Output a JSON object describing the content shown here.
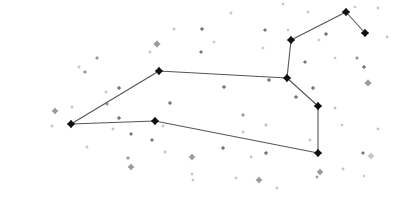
{
  "diagram": {
    "type": "constellation",
    "width": 393,
    "height": 203,
    "colors": {
      "background": "#ffffff",
      "line": "#555555",
      "main_star": "#111111",
      "faint_star_dark": "#777777",
      "faint_star_mid": "#9a9a9a",
      "faint_star_light": "#c4c4c4"
    },
    "main_stars": [
      {
        "id": "A",
        "x": 71,
        "y": 124
      },
      {
        "id": "B",
        "x": 159,
        "y": 71
      },
      {
        "id": "C",
        "x": 155,
        "y": 121
      },
      {
        "id": "D",
        "x": 287,
        "y": 78
      },
      {
        "id": "E",
        "x": 291,
        "y": 40
      },
      {
        "id": "F",
        "x": 346,
        "y": 12
      },
      {
        "id": "G",
        "x": 365,
        "y": 33
      },
      {
        "id": "H",
        "x": 318,
        "y": 106
      },
      {
        "id": "I",
        "x": 318,
        "y": 153
      }
    ],
    "lines": [
      [
        "A",
        "B"
      ],
      [
        "B",
        "D"
      ],
      [
        "A",
        "C"
      ],
      [
        "C",
        "I"
      ],
      [
        "I",
        "H"
      ],
      [
        "H",
        "D"
      ],
      [
        "D",
        "E"
      ],
      [
        "E",
        "F"
      ],
      [
        "F",
        "G"
      ]
    ],
    "background_stars": [
      {
        "x": 55,
        "y": 111,
        "r": 2.2,
        "shade": "mid"
      },
      {
        "x": 52,
        "y": 126,
        "r": 1.2,
        "shade": "light"
      },
      {
        "x": 79,
        "y": 67,
        "r": 1.2,
        "shade": "light"
      },
      {
        "x": 85,
        "y": 72,
        "r": 1.3,
        "shade": "mid"
      },
      {
        "x": 97,
        "y": 58,
        "r": 1.3,
        "shade": "mid"
      },
      {
        "x": 72,
        "y": 107,
        "r": 1.2,
        "shade": "light"
      },
      {
        "x": 87,
        "y": 147,
        "r": 1.2,
        "shade": "light"
      },
      {
        "x": 106,
        "y": 92,
        "r": 1.2,
        "shade": "light"
      },
      {
        "x": 107,
        "y": 104,
        "r": 1.3,
        "shade": "mid"
      },
      {
        "x": 119,
        "y": 88,
        "r": 1.4,
        "shade": "dark"
      },
      {
        "x": 119,
        "y": 118,
        "r": 1.4,
        "shade": "dark"
      },
      {
        "x": 113,
        "y": 129,
        "r": 1.2,
        "shade": "light"
      },
      {
        "x": 131,
        "y": 134,
        "r": 1.3,
        "shade": "dark"
      },
      {
        "x": 128,
        "y": 158,
        "r": 1.3,
        "shade": "mid"
      },
      {
        "x": 131,
        "y": 167,
        "r": 2.2,
        "shade": "mid"
      },
      {
        "x": 152,
        "y": 140,
        "r": 1.3,
        "shade": "dark"
      },
      {
        "x": 150,
        "y": 52,
        "r": 1.2,
        "shade": "light"
      },
      {
        "x": 157,
        "y": 44,
        "r": 2.3,
        "shade": "mid"
      },
      {
        "x": 170,
        "y": 103,
        "r": 1.4,
        "shade": "dark"
      },
      {
        "x": 163,
        "y": 126,
        "r": 1.2,
        "shade": "light"
      },
      {
        "x": 174,
        "y": 29,
        "r": 1.2,
        "shade": "light"
      },
      {
        "x": 192,
        "y": 157,
        "r": 2.2,
        "shade": "mid"
      },
      {
        "x": 192,
        "y": 174,
        "r": 1.2,
        "shade": "light"
      },
      {
        "x": 202,
        "y": 29,
        "r": 1.4,
        "shade": "dark"
      },
      {
        "x": 201,
        "y": 52,
        "r": 1.3,
        "shade": "dark"
      },
      {
        "x": 214,
        "y": 42,
        "r": 1.1,
        "shade": "light"
      },
      {
        "x": 224,
        "y": 87,
        "r": 1.4,
        "shade": "dark"
      },
      {
        "x": 231,
        "y": 13,
        "r": 1.2,
        "shade": "light"
      },
      {
        "x": 243,
        "y": 115,
        "r": 1.3,
        "shade": "mid"
      },
      {
        "x": 263,
        "y": 48,
        "r": 1.1,
        "shade": "light"
      },
      {
        "x": 265,
        "y": 30,
        "r": 1.3,
        "shade": "dark"
      },
      {
        "x": 269,
        "y": 80,
        "r": 1.4,
        "shade": "dark"
      },
      {
        "x": 223,
        "y": 148,
        "r": 1.4,
        "shade": "dark"
      },
      {
        "x": 243,
        "y": 132,
        "r": 1.2,
        "shade": "light"
      },
      {
        "x": 251,
        "y": 157,
        "r": 1.2,
        "shade": "light"
      },
      {
        "x": 259,
        "y": 180,
        "r": 2.2,
        "shade": "mid"
      },
      {
        "x": 277,
        "y": 188,
        "r": 1.2,
        "shade": "light"
      },
      {
        "x": 266,
        "y": 125,
        "r": 1.3,
        "shade": "light"
      },
      {
        "x": 266,
        "y": 153,
        "r": 1.4,
        "shade": "dark"
      },
      {
        "x": 283,
        "y": 4,
        "r": 1.1,
        "shade": "light"
      },
      {
        "x": 288,
        "y": 30,
        "r": 1.1,
        "shade": "light"
      },
      {
        "x": 305,
        "y": 62,
        "r": 1.3,
        "shade": "dark"
      },
      {
        "x": 296,
        "y": 97,
        "r": 1.4,
        "shade": "dark"
      },
      {
        "x": 313,
        "y": 88,
        "r": 1.4,
        "shade": "dark"
      },
      {
        "x": 326,
        "y": 34,
        "r": 1.4,
        "shade": "dark"
      },
      {
        "x": 308,
        "y": 12,
        "r": 1.1,
        "shade": "light"
      },
      {
        "x": 319,
        "y": 40,
        "r": 1.1,
        "shade": "light"
      },
      {
        "x": 310,
        "y": 140,
        "r": 1.2,
        "shade": "light"
      },
      {
        "x": 320,
        "y": 172,
        "r": 2.2,
        "shade": "mid"
      },
      {
        "x": 317,
        "y": 177,
        "r": 1.2,
        "shade": "mid"
      },
      {
        "x": 335,
        "y": 58,
        "r": 1.1,
        "shade": "light"
      },
      {
        "x": 335,
        "y": 108,
        "r": 1.2,
        "shade": "light"
      },
      {
        "x": 342,
        "y": 125,
        "r": 1.1,
        "shade": "light"
      },
      {
        "x": 343,
        "y": 169,
        "r": 1.2,
        "shade": "light"
      },
      {
        "x": 355,
        "y": 7,
        "r": 1.1,
        "shade": "light"
      },
      {
        "x": 357,
        "y": 58,
        "r": 1.3,
        "shade": "mid"
      },
      {
        "x": 364,
        "y": 67,
        "r": 1.4,
        "shade": "dark"
      },
      {
        "x": 368,
        "y": 83,
        "r": 2.3,
        "shade": "mid"
      },
      {
        "x": 363,
        "y": 153,
        "r": 1.3,
        "shade": "dark"
      },
      {
        "x": 371,
        "y": 156,
        "r": 2.2,
        "shade": "light"
      },
      {
        "x": 378,
        "y": 8,
        "r": 1.2,
        "shade": "light"
      },
      {
        "x": 387,
        "y": 37,
        "r": 1.2,
        "shade": "light"
      },
      {
        "x": 378,
        "y": 129,
        "r": 1.2,
        "shade": "light"
      },
      {
        "x": 364,
        "y": 176,
        "r": 1.1,
        "shade": "light"
      },
      {
        "x": 236,
        "y": 178,
        "r": 1.1,
        "shade": "light"
      },
      {
        "x": 165,
        "y": 152,
        "r": 1.2,
        "shade": "light"
      },
      {
        "x": 193,
        "y": 180,
        "r": 1.1,
        "shade": "light"
      }
    ]
  }
}
